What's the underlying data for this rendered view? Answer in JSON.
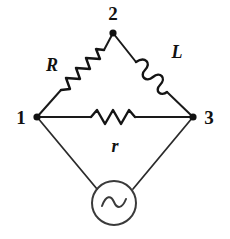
{
  "figure": {
    "type": "circuit-diagram",
    "background_color": "#ffffff",
    "line_color": "#1a1a1a"
  },
  "nodes": [
    {
      "id": "node-2",
      "label": "2",
      "x": 113,
      "y": 33,
      "label_x": 113,
      "label_y": 20
    },
    {
      "id": "node-1",
      "label": "1",
      "x": 37,
      "y": 117,
      "label_x": 21,
      "label_y": 123
    },
    {
      "id": "node-3",
      "label": "3",
      "x": 193,
      "y": 117,
      "label_x": 209,
      "label_y": 123
    }
  ],
  "components": [
    {
      "id": "resistor-R",
      "kind": "resistor",
      "label": "R",
      "branch": "node-1 to node-2",
      "label_x": 52,
      "label_y": 71
    },
    {
      "id": "inductor-L",
      "kind": "inductor",
      "label": "L",
      "branch": "node-2 to node-3",
      "label_x": 177,
      "label_y": 58
    },
    {
      "id": "resistor-r",
      "kind": "resistor",
      "label": "r",
      "branch": "node-1 to node-3",
      "label_x": 115,
      "label_y": 150
    },
    {
      "id": "ac-source",
      "kind": "ac-voltage-source",
      "label": "~",
      "branch": "node-1 to node-3 via bottom vertex",
      "center_x": 114,
      "center_y": 203,
      "radius": 22
    }
  ]
}
